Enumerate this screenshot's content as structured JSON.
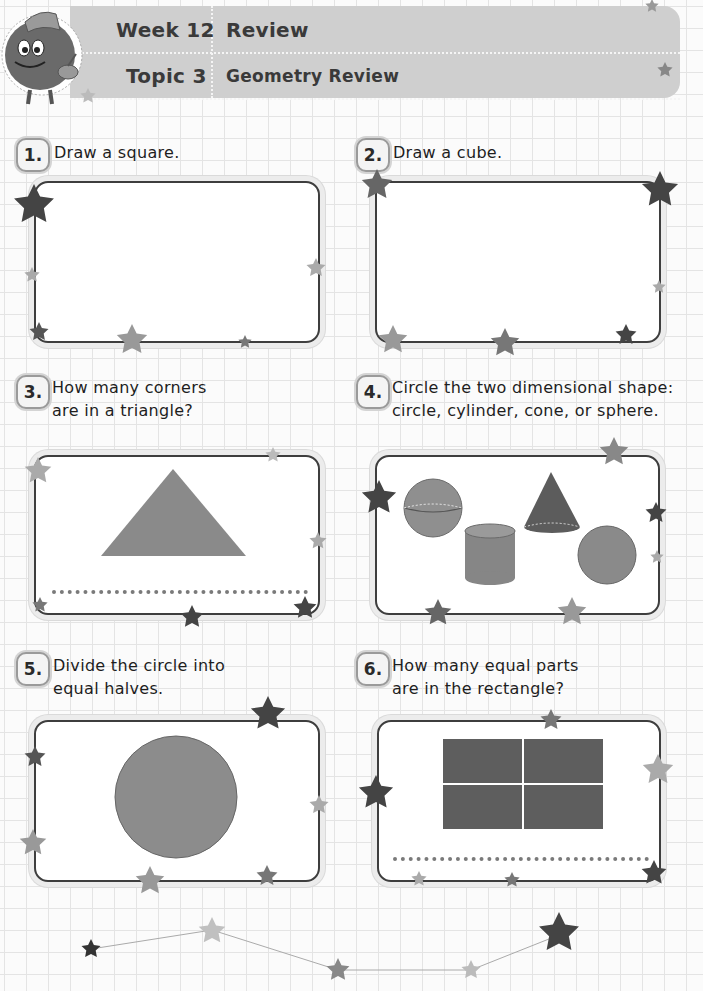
{
  "header": {
    "week_label": "Week 12",
    "week_title": "Review",
    "topic_label": "Topic 3",
    "topic_title": "Geometry Review",
    "mascot_icon": "fuzzy-mascot-with-hat-and-cup"
  },
  "questions": [
    {
      "number": "1.",
      "text_lines": [
        "Draw a square."
      ],
      "figure": "empty-drawing-area",
      "answer_line": false
    },
    {
      "number": "2.",
      "text_lines": [
        "Draw a cube."
      ],
      "figure": "empty-drawing-area",
      "answer_line": false
    },
    {
      "number": "3.",
      "text_lines": [
        "How many corners",
        "are in a triangle?"
      ],
      "figure": "triangle",
      "answer_line": true
    },
    {
      "number": "4.",
      "text_lines": [
        "Circle the two dimensional shape:",
        "circle, cylinder, cone, or sphere."
      ],
      "figure": [
        "sphere",
        "cylinder",
        "cone",
        "circle"
      ],
      "answer_line": false
    },
    {
      "number": "5.",
      "text_lines": [
        "Divide the circle into",
        "equal halves."
      ],
      "figure": "circle",
      "answer_line": false
    },
    {
      "number": "6.",
      "text_lines": [
        "How many equal parts",
        "are in the rectangle?"
      ],
      "figure": "rectangle-4-parts",
      "answer_line": true
    }
  ],
  "colors": {
    "banner": "#cfcfcf",
    "shape_fill": "#8a8a8a",
    "shape_dark": "#5a5a5a",
    "box_border": "#3e3e3e",
    "grid": "#e4e4e4"
  },
  "footer": {
    "decoration": "star-constellation"
  }
}
